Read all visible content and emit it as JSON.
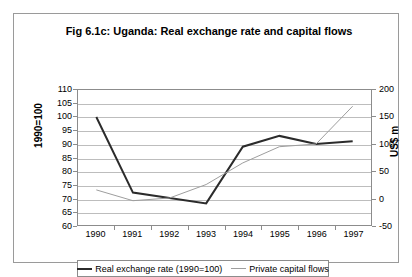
{
  "figure": {
    "title": "Fig 6.1c: Uganda: Real exchange rate and capital flows"
  },
  "chart_data": {
    "type": "line",
    "title": "Fig 6.1c: Uganda: Real exchange rate and capital flows",
    "xlabel": "",
    "categories": [
      "1990",
      "1991",
      "1992",
      "1993",
      "1994",
      "1995",
      "1996",
      "1997"
    ],
    "grid": true,
    "legend_position": "bottom",
    "axes": {
      "left": {
        "label": "1990=100",
        "ylim": [
          60,
          110
        ],
        "ticks": [
          110,
          105,
          100,
          95,
          90,
          85,
          80,
          75,
          70,
          65,
          60
        ],
        "color": "#2b2b2b"
      },
      "right": {
        "label": "US$ m",
        "ylim": [
          -50,
          200
        ],
        "ticks": [
          200,
          150,
          100,
          50,
          0,
          -50
        ],
        "color": "#9e9e9e"
      }
    },
    "series": [
      {
        "name": "Real exchange rate (1990=100)",
        "axis": "left",
        "color": "#2b2b2b",
        "width": 2,
        "values": [
          100,
          72,
          70,
          68,
          89,
          93,
          90,
          91
        ]
      },
      {
        "name": "Private capital flows",
        "axis": "right",
        "color": "#9e9e9e",
        "width": 1,
        "values": [
          15,
          -5,
          0,
          25,
          65,
          95,
          100,
          170
        ]
      }
    ]
  }
}
